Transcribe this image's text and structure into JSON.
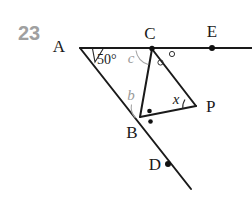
{
  "figure": {
    "problem_number": "23",
    "caption_color": "#a0a0a0",
    "line_color": "#1a1a1a",
    "background": "#ffffff"
  },
  "labels": {
    "A": "A",
    "B": "B",
    "C": "C",
    "D": "D",
    "E": "E",
    "P": "P"
  },
  "angles": {
    "at_A": "50°",
    "at_C_var": "c",
    "at_B_var": "b",
    "at_P_var": "x"
  },
  "points": {
    "A": {
      "x": 82,
      "y": 48
    },
    "C": {
      "x": 152,
      "y": 49
    },
    "E": {
      "x": 212,
      "y": 48
    },
    "B": {
      "x": 140,
      "y": 117
    },
    "P": {
      "x": 196,
      "y": 105
    },
    "D": {
      "x": 168,
      "y": 164
    }
  },
  "segments": [
    {
      "name": "line-A-to-E",
      "from": "A",
      "to": "right-edge"
    },
    {
      "name": "line-A-to-D",
      "from": "A",
      "to": "bottom-right-edge"
    },
    {
      "name": "segment-C-to-B",
      "from": "C",
      "to": "B"
    },
    {
      "name": "segment-C-to-P",
      "from": "C",
      "to": "P"
    },
    {
      "name": "segment-B-to-P",
      "from": "B",
      "to": "P"
    }
  ],
  "marks": {
    "equal_angle_circles_at_C": 2,
    "equal_angle_dots_at_B": 2,
    "dot_on_E": true,
    "dot_on_D": true,
    "dot_on_C": true
  }
}
